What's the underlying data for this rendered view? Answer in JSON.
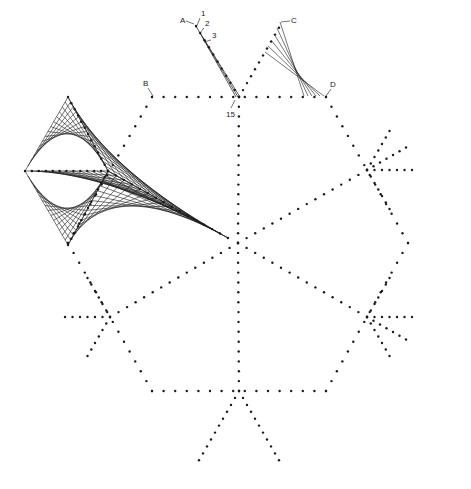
{
  "diagram": {
    "colors": {
      "ink": "#1a1a1a",
      "background": "#ffffff"
    },
    "center": [
      238,
      243
    ],
    "hexagon_vertices": [
      [
        152,
        97
      ],
      [
        326,
        97
      ],
      [
        408,
        243
      ],
      [
        326,
        391
      ],
      [
        152,
        391
      ],
      [
        68,
        243
      ]
    ],
    "dot_spacing": 8,
    "labels": [
      {
        "id": "A",
        "text": "A",
        "x": 180,
        "y": 23,
        "leader": [
          [
            186,
            21
          ],
          [
            194,
            24
          ]
        ]
      },
      {
        "id": "1",
        "text": "1",
        "x": 201,
        "y": 16,
        "leader": [
          [
            200,
            18
          ],
          [
            196,
            28
          ]
        ]
      },
      {
        "id": "2",
        "text": "2",
        "x": 205,
        "y": 26,
        "leader": [
          [
            204,
            28
          ],
          [
            199,
            34
          ]
        ]
      },
      {
        "id": "3",
        "text": "3",
        "x": 212,
        "y": 38,
        "leader": [
          [
            211,
            40
          ],
          [
            204,
            42
          ]
        ]
      },
      {
        "id": "15",
        "text": "15",
        "x": 226,
        "y": 117,
        "leader": [
          [
            231,
            108
          ],
          [
            235,
            100
          ]
        ]
      },
      {
        "id": "B",
        "text": "B",
        "x": 143,
        "y": 86,
        "leader": [
          [
            148,
            88
          ],
          [
            153,
            96
          ]
        ]
      },
      {
        "id": "C",
        "text": "C",
        "x": 291,
        "y": 23,
        "leader": [
          [
            290,
            21
          ],
          [
            281,
            22
          ]
        ]
      },
      {
        "id": "D",
        "text": "D",
        "x": 330,
        "y": 87,
        "leader": [
          [
            331,
            89
          ],
          [
            326,
            96
          ]
        ]
      }
    ]
  }
}
